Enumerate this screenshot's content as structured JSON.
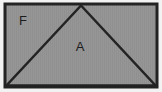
{
  "figure": {
    "canvas": {
      "width": 162,
      "height": 92,
      "background": "#f2f2f2"
    },
    "colors": {
      "fill": "#969696",
      "stroke": "#232323",
      "label_text": "#1c1c1c",
      "page_background": "#f2f2f2"
    },
    "rectangle": {
      "name": "outer-rectangle",
      "x": 5,
      "y": 4,
      "width": 152,
      "height": 83,
      "stroke_width": 3,
      "fill": "#969696"
    },
    "triangle": {
      "name": "inscribed-triangle",
      "apex": {
        "x": 81,
        "y": 5.5
      },
      "base_left": {
        "x": 6.5,
        "y": 85.5
      },
      "base_right": {
        "x": 155.5,
        "y": 85.5
      },
      "stroke_width": 2.5,
      "fill": "#969696"
    },
    "labels": [
      {
        "id": "label-f",
        "text": "F",
        "x": 23,
        "y": 22,
        "region": "upper-left-corner-triangle",
        "font_size": 13
      },
      {
        "id": "label-a",
        "text": "A",
        "x": 80,
        "y": 48,
        "region": "inscribed-triangle-interior",
        "font_size": 13
      }
    ]
  }
}
